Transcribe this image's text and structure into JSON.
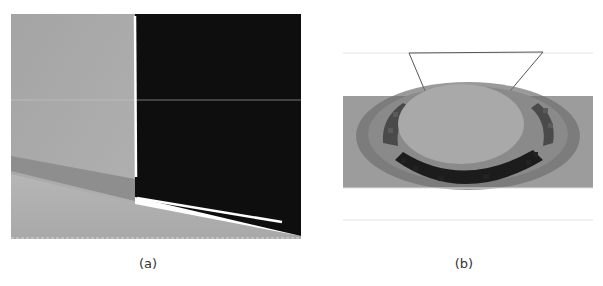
{
  "figure": {
    "panels": [
      {
        "id": "a",
        "caption": "(a)",
        "description": "Wall corner image with a white vertical line along the wall edge and a white sloped line along the floor boundary; right half is a dark masked region",
        "colors": {
          "wall": "#a9a9a9",
          "mask": "#0d0d0d",
          "floor": "#b4b4b4",
          "baseboard": "#8c8c8c",
          "line": "#ffffff"
        }
      },
      {
        "id": "b",
        "caption": "(b)",
        "description": "Pixelated grayscale heatmap strip with an oval light region and a dark crescent below, topped by a trapezoid outline",
        "colors": {
          "background": "#9a9a9a",
          "oval": "#a8a8a8",
          "dark_band": "#1e1e1e",
          "outline": "#555555"
        }
      }
    ]
  }
}
